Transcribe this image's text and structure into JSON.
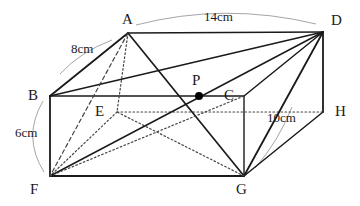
{
  "figure": {
    "kind": "cuboid-with-diagonals",
    "colors": {
      "stroke": "#1a1a1a",
      "hidden_stroke": "#444444",
      "leader_stroke": "#9a9a9a",
      "background": "#ffffff",
      "point_fill": "#000000"
    }
  },
  "vertices": [
    {
      "id": "A",
      "label": "A",
      "x": 128,
      "y": 33,
      "label_x": 122,
      "label_y": 12,
      "hidden": false
    },
    {
      "id": "D",
      "label": "D",
      "x": 323,
      "y": 32,
      "label_x": 331,
      "label_y": 13,
      "hidden": false
    },
    {
      "id": "B",
      "label": "B",
      "x": 50,
      "y": 96,
      "label_x": 28,
      "label_y": 88,
      "hidden": false
    },
    {
      "id": "C",
      "label": "C",
      "x": 244,
      "y": 96,
      "label_x": 224,
      "label_y": 88,
      "hidden": false
    },
    {
      "id": "E",
      "label": "E",
      "x": 117,
      "y": 112,
      "label_x": 95,
      "label_y": 104,
      "hidden": true
    },
    {
      "id": "H",
      "label": "H",
      "x": 323,
      "y": 112,
      "label_x": 335,
      "label_y": 104,
      "hidden": true
    },
    {
      "id": "F",
      "label": "F",
      "x": 50,
      "y": 176,
      "label_x": 30,
      "label_y": 182,
      "hidden": false
    },
    {
      "id": "G",
      "label": "G",
      "x": 244,
      "y": 176,
      "label_x": 236,
      "label_y": 182,
      "hidden": false
    }
  ],
  "marked_points": [
    {
      "id": "P",
      "label": "P",
      "x": 199,
      "y": 96,
      "label_x": 192,
      "label_y": 73,
      "radius": 4
    }
  ],
  "edges": [
    {
      "from": "A",
      "to": "D",
      "style": "solid",
      "width": 1.6,
      "name": "edge-a-d"
    },
    {
      "from": "A",
      "to": "B",
      "style": "solid",
      "width": 1.8,
      "name": "edge-a-b"
    },
    {
      "from": "B",
      "to": "C",
      "style": "solid",
      "width": 1.6,
      "name": "edge-b-c"
    },
    {
      "from": "C",
      "to": "D",
      "style": "solid",
      "width": 1.5,
      "name": "edge-c-d"
    },
    {
      "from": "B",
      "to": "F",
      "style": "solid",
      "width": 1.8,
      "name": "edge-b-f"
    },
    {
      "from": "C",
      "to": "G",
      "style": "solid",
      "width": 1.4,
      "name": "edge-c-g"
    },
    {
      "from": "F",
      "to": "G",
      "style": "solid",
      "width": 2.0,
      "name": "edge-f-g"
    },
    {
      "from": "D",
      "to": "H",
      "style": "solid",
      "width": 1.8,
      "name": "edge-d-h"
    },
    {
      "from": "G",
      "to": "H",
      "style": "solid",
      "width": 1.5,
      "name": "edge-g-h"
    },
    {
      "from": "A",
      "to": "E",
      "style": "dotted",
      "width": 1.2,
      "name": "edge-a-e-hidden"
    },
    {
      "from": "E",
      "to": "H",
      "style": "dotted",
      "width": 1.2,
      "name": "edge-e-h-hidden"
    },
    {
      "from": "E",
      "to": "F",
      "style": "dotted",
      "width": 1.2,
      "name": "edge-e-f-hidden"
    },
    {
      "from": "A",
      "to": "G",
      "style": "solid",
      "width": 1.7,
      "name": "diagonal-a-g"
    },
    {
      "from": "B",
      "to": "D",
      "style": "solid",
      "width": 1.5,
      "name": "diagonal-b-d"
    },
    {
      "from": "D",
      "to": "G",
      "style": "solid",
      "width": 1.8,
      "name": "diagonal-d-g"
    },
    {
      "from": "D",
      "to": "F",
      "style": "solid",
      "width": 1.5,
      "name": "diagonal-d-f"
    },
    {
      "from": "A",
      "to": "F",
      "style": "dashed",
      "width": 1.2,
      "name": "diagonal-a-f"
    },
    {
      "from": "F",
      "to": "C",
      "style": "dotted",
      "width": 1.2,
      "name": "diagonal-f-c-hidden"
    },
    {
      "from": "G",
      "to": "E",
      "style": "dotted",
      "width": 1.2,
      "name": "diagonal-g-e-hidden"
    }
  ],
  "dimensions": [
    {
      "id": "ab",
      "text": "8cm",
      "label_x": 71,
      "label_y": 42,
      "name": "dimension-label-8cm",
      "leader": "M 60 74 Q 80 52 112 40"
    },
    {
      "id": "ad",
      "text": "14cm",
      "label_x": 204,
      "label_y": 10,
      "name": "dimension-label-14cm",
      "leader": "M 136 25 Q 225 2 316 24"
    },
    {
      "id": "bf",
      "text": "6cm",
      "label_x": 15,
      "label_y": 126,
      "name": "dimension-label-6cm",
      "leader": "M 43 101 Q 22 137 44 172"
    },
    {
      "id": "gh",
      "text": "10cm",
      "label_x": 267,
      "label_y": 111,
      "name": "dimension-label-10cm",
      "leader": "M 255 168 Q 278 142 292 107"
    }
  ]
}
